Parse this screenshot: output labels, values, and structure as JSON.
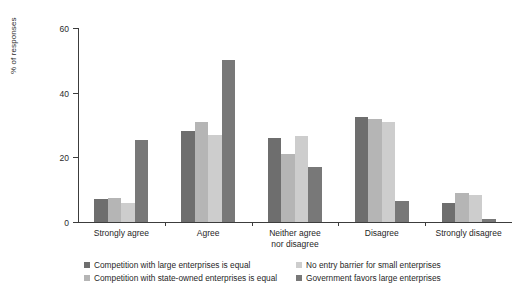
{
  "chart_data": {
    "type": "bar",
    "title": "",
    "subtitle": "",
    "xlabel": "",
    "ylabel": "% of responses",
    "ylim": [
      0,
      60
    ],
    "yticks": [
      0,
      20,
      40,
      60
    ],
    "ytick_labels": [
      "0",
      "20",
      "40",
      "60"
    ],
    "grid": false,
    "legend_position": "bottom",
    "orientation": "vertical",
    "grouping": "grouped",
    "categories": [
      "Strongly agree",
      "Agree",
      "Neither agree\nnor disagree",
      "Disagree",
      "Strongly disagree"
    ],
    "series": [
      {
        "name": "Competition with large enterprises is equal",
        "color": "#6e6e6e",
        "values": [
          7.0,
          28.0,
          26.0,
          32.5,
          6.0
        ]
      },
      {
        "name": "Competition with state-owned enterprises is equal",
        "color": "#b5b5b5",
        "values": [
          7.5,
          31.0,
          21.0,
          32.0,
          9.0
        ]
      },
      {
        "name": "No entry barrier for small enterprises",
        "color": "#cdcdcd",
        "values": [
          6.0,
          27.0,
          26.5,
          31.0,
          8.5
        ]
      },
      {
        "name": "Government favors large enterprises",
        "color": "#787878",
        "values": [
          25.5,
          50.0,
          17.0,
          6.5,
          0.8
        ]
      }
    ],
    "legend_entries": [
      "Competition with large enterprises is equal",
      "No entry barrier for small enterprises",
      "Competition with state-owned enterprises is equal",
      "Government favors large enterprises"
    ]
  },
  "colors": {
    "axis": "#3c3c3c",
    "text": "#1f1f1f",
    "background": "#ffffff"
  }
}
